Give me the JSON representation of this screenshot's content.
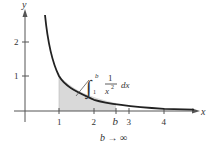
{
  "figure": {
    "axes": {
      "x_label": "x",
      "y_label": "y",
      "x_ticks": [
        "1",
        "2",
        "3",
        "4"
      ],
      "y_ticks": [
        "1",
        "2"
      ],
      "b_marker": "b"
    },
    "integral": {
      "sign": "∫",
      "upper": "b",
      "lower": "1",
      "numerator": "1",
      "denominator_base": "x",
      "denominator_exp": "2",
      "differential": "dx"
    },
    "caption": "b → ∞",
    "colors": {
      "curve": "#222222",
      "shade": "#d9d9d9",
      "axis": "#555555"
    }
  }
}
